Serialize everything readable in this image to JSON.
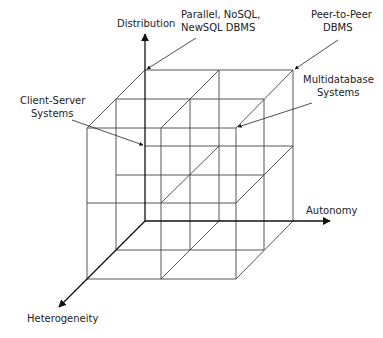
{
  "axes": {
    "distribution": "Distribution",
    "autonomy": "Autonomy",
    "heterogeneity": "Heterogeneity"
  },
  "annotations": {
    "parallel": [
      "Parallel, NoSQL,",
      "NewSQL DBMS"
    ],
    "p2p": [
      "Peer-to-Peer",
      "DBMS"
    ],
    "multidb": [
      "Multidatabase",
      "Systems"
    ],
    "client_server": [
      "Client-Server",
      "Systems"
    ]
  },
  "colors": {
    "edge": "#444444",
    "axis": "#111111",
    "text": "#222222"
  }
}
